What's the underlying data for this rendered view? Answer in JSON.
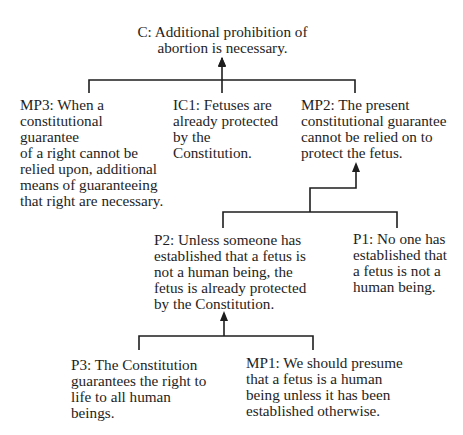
{
  "diagram": {
    "type": "argument-map",
    "nodes": {
      "C": {
        "id": "C",
        "text": "C: Additional prohibition of\nabortion is necessary."
      },
      "MP3": {
        "id": "MP3",
        "text": "MP3: When a\nconstitutional guarantee\nof a right cannot be\nrelied upon, additional\nmeans of guaranteeing\nthat right are necessary."
      },
      "IC1": {
        "id": "IC1",
        "text": "IC1: Fetuses are\nalready protected\nby the Constitution."
      },
      "MP2": {
        "id": "MP2",
        "text": "MP2: The present\nconstitutional guarantee\ncannot be relied on to\nprotect the fetus."
      },
      "P2": {
        "id": "P2",
        "text": "P2: Unless someone has\nestablished that a fetus is\nnot a human being, the\nfetus is already protected\nby the Constitution."
      },
      "P1": {
        "id": "P1",
        "text": "P1: No one has\nestablished that\na fetus is not a\nhuman being."
      },
      "P3": {
        "id": "P3",
        "text": "P3: The Constitution\nguarantees the right to\nlife to all human beings."
      },
      "MP1": {
        "id": "MP1",
        "text": "MP1: We should presume\nthat a fetus is a human\nbeing unless it has been\nestablished otherwise."
      }
    },
    "edges": [
      {
        "from": [
          "MP3",
          "IC1",
          "MP2"
        ],
        "to": "C"
      },
      {
        "from": [
          "P2",
          "P1"
        ],
        "to": "MP2"
      },
      {
        "from": [
          "P3",
          "MP1"
        ],
        "to": "P2"
      }
    ],
    "line_color": "#1e1e1e"
  }
}
